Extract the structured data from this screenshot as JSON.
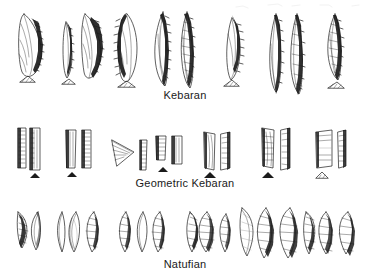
{
  "figure": {
    "background_color": "#ffffff",
    "ink_color": "#1b1b1b",
    "width": 370,
    "height": 278
  },
  "rows": [
    {
      "id": "kebaran",
      "label": "Kebaran",
      "label_y": 96,
      "row_top": 8,
      "row_height": 80,
      "description": "Backed and obliquely truncated bladelets, curved backed bladelets, micropoints",
      "groups": [
        {
          "name": "group-1",
          "x": 14,
          "pieces": 2,
          "forms": [
            "backed-bladelet",
            "section-profile"
          ]
        },
        {
          "name": "group-2",
          "x": 62,
          "pieces": 3,
          "forms": [
            "backed-bladelet",
            "backed-bladelet",
            "section-profile"
          ]
        },
        {
          "name": "group-3",
          "x": 112,
          "pieces": 2,
          "forms": [
            "backed-bladelet",
            "section-profile"
          ]
        },
        {
          "name": "group-4",
          "x": 152,
          "pieces": 2,
          "forms": [
            "curved-backed-bladelet",
            "curved-backed-bladelet"
          ]
        },
        {
          "name": "group-5",
          "x": 222,
          "pieces": 2,
          "forms": [
            "backed-bladelet",
            "section-profile"
          ]
        },
        {
          "name": "group-6",
          "x": 264,
          "pieces": 2,
          "forms": [
            "long-backed-bladelet",
            "long-backed-bladelet"
          ]
        },
        {
          "name": "group-7",
          "x": 322,
          "pieces": 2,
          "forms": [
            "curved-backed-bladelet",
            "section-profile"
          ]
        }
      ]
    },
    {
      "id": "geometric-kebaran",
      "label": "Geometric Kebaran",
      "label_y": 182,
      "row_top": 126,
      "row_height": 54,
      "description": "Geometric microliths: rectangles, trapeze-rectangles, triangles with backed edges",
      "groups": [
        {
          "name": "group-1",
          "x": 16,
          "pieces": 3,
          "forms": [
            "rectangle-microlith",
            "rectangle-microlith",
            "basal-profile"
          ]
        },
        {
          "name": "group-2",
          "x": 62,
          "pieces": 3,
          "forms": [
            "rectangle-microlith",
            "rectangle-microlith",
            "basal-profile"
          ]
        },
        {
          "name": "group-3",
          "x": 106,
          "pieces": 2,
          "forms": [
            "triangle-microlith",
            "narrow-backed-piece"
          ]
        },
        {
          "name": "group-4",
          "x": 152,
          "pieces": 3,
          "forms": [
            "short-rectangle",
            "short-rectangle",
            "basal-profile"
          ]
        },
        {
          "name": "group-5",
          "x": 198,
          "pieces": 3,
          "forms": [
            "trapeze-rectangle",
            "trapeze-rectangle",
            "basal-profile"
          ]
        },
        {
          "name": "group-6",
          "x": 256,
          "pieces": 3,
          "forms": [
            "rectangle-microlith",
            "rectangle-microlith",
            "basal-profile"
          ]
        },
        {
          "name": "group-7",
          "x": 312,
          "pieces": 3,
          "forms": [
            "wide-rectangle",
            "narrow-backed-piece",
            "basal-profile"
          ]
        }
      ]
    },
    {
      "id": "natufian",
      "label": "Natufian",
      "label_y": 262,
      "row_top": 208,
      "row_height": 48,
      "description": "Lunates (crescents) with backed arcs, Helwan and abrupt retouch",
      "groups": [
        {
          "name": "group-1",
          "x": 16,
          "pieces": 2,
          "forms": [
            "lunate",
            "lunate"
          ]
        },
        {
          "name": "group-2",
          "x": 58,
          "pieces": 3,
          "forms": [
            "lunate",
            "lunate",
            "lunate"
          ]
        },
        {
          "name": "group-3",
          "x": 122,
          "pieces": 3,
          "forms": [
            "lunate",
            "lunate",
            "lunate"
          ]
        },
        {
          "name": "group-4",
          "x": 186,
          "pieces": 3,
          "forms": [
            "lunate",
            "lunate",
            "lunate"
          ]
        },
        {
          "name": "group-5",
          "x": 236,
          "pieces": 3,
          "forms": [
            "large-lunate",
            "large-lunate",
            "large-lunate"
          ]
        },
        {
          "name": "group-6",
          "x": 300,
          "pieces": 3,
          "forms": [
            "lunate",
            "lunate",
            "lunate"
          ]
        }
      ]
    }
  ]
}
